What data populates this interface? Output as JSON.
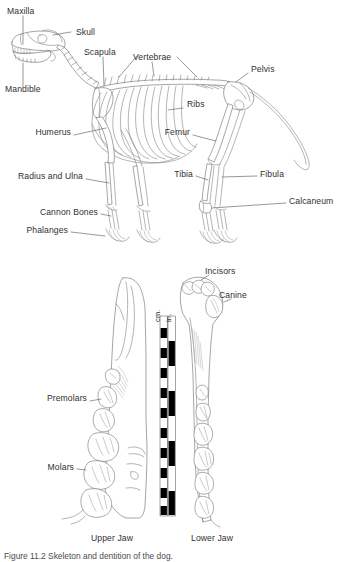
{
  "figure": {
    "background_color": "#ffffff",
    "line_color": "#6d6f72",
    "text_color": "#2f3032"
  },
  "skeleton_panel": {
    "name": "skeleton-diagram",
    "subject": "dog skeleton lateral view",
    "labels": [
      {
        "id": "maxilla",
        "text": "Maxilla"
      },
      {
        "id": "skull",
        "text": "Skull"
      },
      {
        "id": "scapula",
        "text": "Scapula"
      },
      {
        "id": "vertebrae",
        "text": "Vertebrae"
      },
      {
        "id": "pelvis",
        "text": "Pelvis"
      },
      {
        "id": "mandible",
        "text": "Mandible"
      },
      {
        "id": "ribs",
        "text": "Ribs"
      },
      {
        "id": "humerus",
        "text": "Humerus"
      },
      {
        "id": "femur",
        "text": "Femur"
      },
      {
        "id": "radius-ulna",
        "text": "Radius and Ulna"
      },
      {
        "id": "tibia",
        "text": "Tibia"
      },
      {
        "id": "fibula",
        "text": "Fibula"
      },
      {
        "id": "cannon-bones",
        "text": "Cannon Bones"
      },
      {
        "id": "calcaneum",
        "text": "Calcaneum"
      },
      {
        "id": "phalanges",
        "text": "Phalanges"
      }
    ]
  },
  "jaw_panel": {
    "name": "jaw-dentition-diagram",
    "labels": [
      {
        "id": "incisors",
        "text": "Incisors"
      },
      {
        "id": "canine",
        "text": "Canine"
      },
      {
        "id": "premolars",
        "text": "Premolars"
      },
      {
        "id": "molars",
        "text": "Molars"
      }
    ],
    "captions": [
      {
        "id": "upper-jaw",
        "text": "Upper Jaw"
      },
      {
        "id": "lower-jaw",
        "text": "Lower Jaw"
      }
    ],
    "scale_bar": {
      "name": "scale-bar",
      "units": [
        "cm.",
        "in."
      ],
      "cm_label": "cm.",
      "in_label": "in.",
      "cm_segments": 10,
      "in_segments": 4
    }
  },
  "figure_caption": {
    "text": "Figure 11.2   Skeleton and dentition of the dog."
  }
}
